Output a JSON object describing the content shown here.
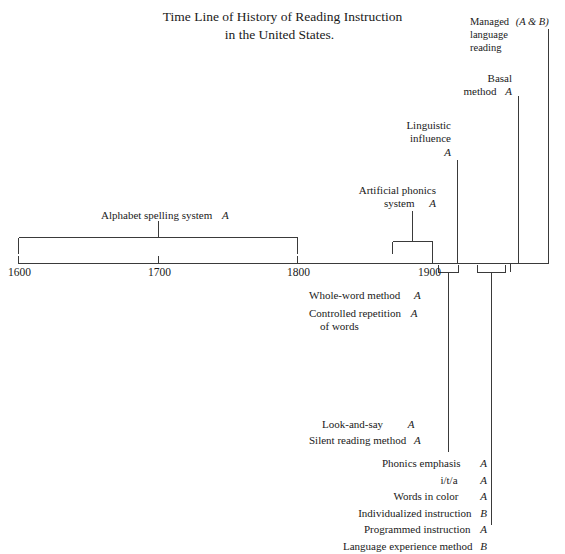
{
  "title": {
    "line1": "Time Line of History of Reading Instruction",
    "line2": "in the United States."
  },
  "axis": {
    "ticks": [
      {
        "label": "1600",
        "x": 1600
      },
      {
        "label": "1700",
        "x": 1700
      },
      {
        "label": "1800",
        "x": 1800
      },
      {
        "label": "1900",
        "x": 1900
      }
    ]
  },
  "annotations": {
    "alphabet_spelling": {
      "line1": "Alphabet spelling system",
      "code": "A"
    },
    "artificial_phonics": {
      "line1": "Artificial phonics",
      "line2": "system",
      "code": "A"
    },
    "linguistic_influence": {
      "line1": "Linguistic",
      "line2": "influence",
      "code": "A"
    },
    "basal_method": {
      "line1": "Basal",
      "line2": "method",
      "code": "A"
    },
    "managed_language_reading": {
      "line1": "Managed",
      "code": "(A & B)",
      "line2": "language",
      "line3": "reading"
    },
    "whole_word": {
      "line1": "Whole-word method",
      "code": "A"
    },
    "controlled_repetition": {
      "line1": "Controlled repetition",
      "code": "A",
      "line2": "of words"
    },
    "look_and_say": {
      "line1": "Look-and-say",
      "code": "A"
    },
    "silent_reading": {
      "line1": "Silent reading method",
      "code": "A"
    },
    "phonics_emphasis": {
      "line1": "Phonics emphasis",
      "code": "A"
    },
    "ita": {
      "line1": "i/t/a",
      "code": "A"
    },
    "words_in_color": {
      "line1": "Words in color",
      "code": "A"
    },
    "individualized_instruction": {
      "line1": "Individualized instruction",
      "code": "B"
    },
    "programmed_instruction": {
      "line1": "Programmed instruction",
      "code": "A"
    },
    "language_experience": {
      "line1": "Language experience method",
      "code": "B"
    }
  },
  "colors": {
    "ink": "#1a1a1a",
    "line": "#3a3a3a",
    "background": "#ffffff"
  }
}
